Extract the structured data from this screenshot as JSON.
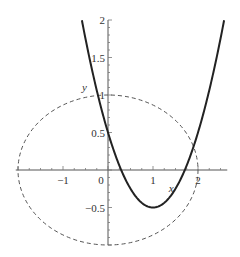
{
  "chart_data": {
    "type": "line",
    "title": "",
    "xlabel": "x",
    "ylabel": "y",
    "xlim": [
      -2.05,
      2.65
    ],
    "ylim": [
      -1.0,
      2.0
    ],
    "grid": false,
    "legend": null,
    "x_ticks": [
      {
        "value": -1,
        "label": "−1"
      },
      {
        "value": 0,
        "label": "0"
      },
      {
        "value": 1,
        "label": "1"
      },
      {
        "value": 2,
        "label": "2"
      }
    ],
    "y_ticks": [
      {
        "value": 2,
        "label": "2"
      },
      {
        "value": 1.5,
        "label": "1.5"
      },
      {
        "value": 1,
        "label": "1"
      },
      {
        "value": 0.5,
        "label": "0.5"
      },
      {
        "value": -0.5,
        "label": "−0.5"
      }
    ],
    "series": [
      {
        "name": "parabola",
        "style": "solid",
        "color": "#222222",
        "equation": "y = (x - 1)^2 - 0.5",
        "x": [
          -0.58,
          -0.5,
          -0.25,
          0,
          0.25,
          0.5,
          0.75,
          1,
          1.25,
          1.5,
          1.75,
          2,
          2.25,
          2.5,
          2.58
        ],
        "y": [
          2.0,
          1.75,
          1.06,
          0.5,
          0.06,
          -0.25,
          -0.44,
          -0.5,
          -0.44,
          -0.25,
          0.06,
          0.5,
          1.06,
          1.75,
          2.0
        ]
      },
      {
        "name": "ellipse",
        "style": "dashed",
        "color": "#555555",
        "equation": "x^2/4 + y^2 = 1",
        "center": [
          0,
          0
        ],
        "rx": 2,
        "ry": 1
      }
    ]
  }
}
